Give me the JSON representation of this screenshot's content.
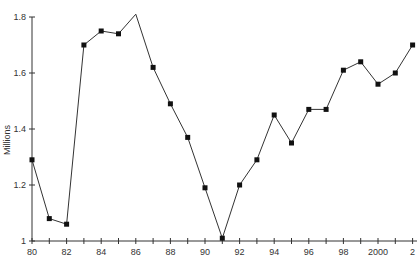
{
  "chart_data": {
    "type": "line",
    "title": "",
    "xlabel": "",
    "ylabel": "Millions",
    "ylim": [
      1,
      1.8
    ],
    "xlim": [
      1980,
      2002
    ],
    "grid": false,
    "legend": null,
    "x": [
      1980,
      1981,
      1982,
      1983,
      1984,
      1985,
      1986,
      1987,
      1988,
      1989,
      1990,
      1991,
      1992,
      1993,
      1994,
      1995,
      1996,
      1997,
      1998,
      1999,
      2000,
      2001,
      2002
    ],
    "series": [
      {
        "name": "Millions",
        "values": [
          1.29,
          1.08,
          1.06,
          1.7,
          1.75,
          1.74,
          1.81,
          1.62,
          1.49,
          1.37,
          1.19,
          1.01,
          1.2,
          1.29,
          1.45,
          1.35,
          1.47,
          1.47,
          1.61,
          1.64,
          1.56,
          1.6,
          1.7
        ],
        "markers": [
          true,
          true,
          true,
          true,
          true,
          true,
          false,
          true,
          true,
          true,
          true,
          true,
          true,
          true,
          true,
          true,
          true,
          true,
          true,
          true,
          true,
          true,
          true
        ]
      }
    ],
    "y_ticks": [
      "1",
      "1.2",
      "1.4",
      "1.6",
      "1.8"
    ],
    "x_tick_labels": [
      "80",
      "82",
      "84",
      "86",
      "88",
      "90",
      "92",
      "94",
      "96",
      "98",
      "2000",
      "2"
    ],
    "colors": {
      "line": "#333333",
      "marker": "#111111",
      "axis": "#333333"
    }
  }
}
